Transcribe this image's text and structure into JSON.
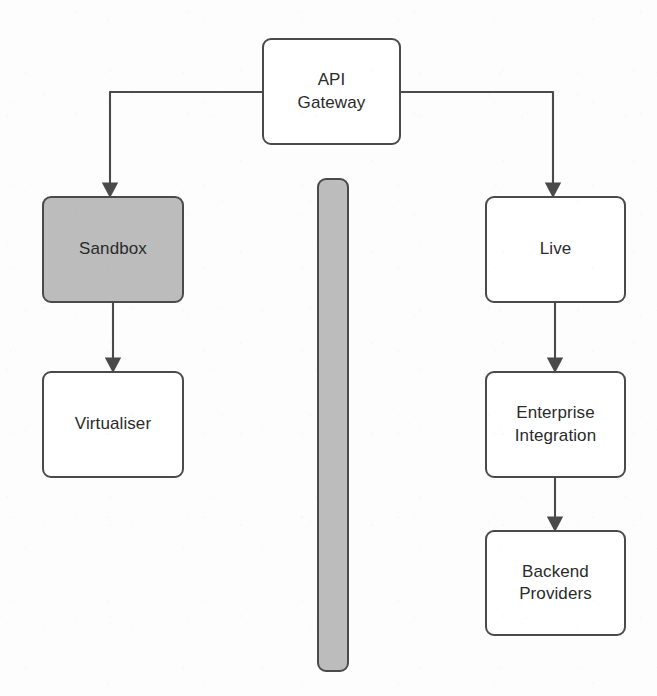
{
  "diagram": {
    "colors": {
      "stroke": "#4a4a4a",
      "shaded_fill": "#bcbcbc",
      "plain_fill": "#ffffff",
      "text": "#2b2b2b",
      "background": "#fdfdfd"
    },
    "nodes": [
      {
        "id": "api-gateway",
        "label": "API\nGateway",
        "fill": "plain",
        "x": 262,
        "y": 38,
        "width": 139,
        "height": 107
      },
      {
        "id": "sandbox",
        "label": "Sandbox",
        "fill": "shaded",
        "x": 42,
        "y": 196,
        "width": 142,
        "height": 107
      },
      {
        "id": "virtualiser",
        "label": "Virtualiser",
        "fill": "plain",
        "x": 42,
        "y": 371,
        "width": 142,
        "height": 107
      },
      {
        "id": "live",
        "label": "Live",
        "fill": "plain",
        "x": 485,
        "y": 196,
        "width": 141,
        "height": 107
      },
      {
        "id": "enterprise-integration",
        "label": "Enterprise\nIntegration",
        "fill": "plain",
        "x": 485,
        "y": 371,
        "width": 141,
        "height": 107
      },
      {
        "id": "backend-providers",
        "label": "Backend\nProviders",
        "fill": "plain",
        "x": 485,
        "y": 530,
        "width": 141,
        "height": 106
      }
    ],
    "separator": {
      "id": "vertical-divider",
      "label": "",
      "fill": "shaded",
      "x": 317,
      "y": 178,
      "width": 32,
      "height": 494
    },
    "edges": [
      {
        "id": "api-gateway-to-sandbox",
        "from": "api-gateway",
        "to": "sandbox",
        "arrow": true,
        "path": "M 262 92 L 110 92 L 110 190"
      },
      {
        "id": "api-gateway-to-live",
        "from": "api-gateway",
        "to": "live",
        "arrow": true,
        "path": "M 401 92 L 553 92 L 553 190"
      },
      {
        "id": "sandbox-to-virtualiser",
        "from": "sandbox",
        "to": "virtualiser",
        "arrow": true,
        "path": "M 113 303 L 113 365"
      },
      {
        "id": "live-to-enterprise-integration",
        "from": "live",
        "to": "enterprise-integration",
        "arrow": true,
        "path": "M 555 303 L 555 365"
      },
      {
        "id": "enterprise-integration-to-backend-providers",
        "from": "enterprise-integration",
        "to": "backend-providers",
        "arrow": true,
        "path": "M 555 478 L 555 524"
      }
    ]
  }
}
